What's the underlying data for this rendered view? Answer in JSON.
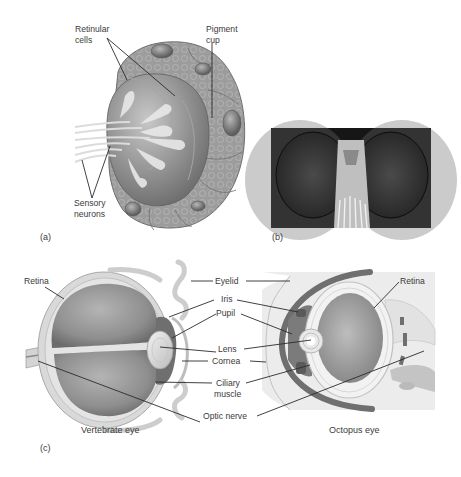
{
  "panel_a": {
    "part_label": "(a)",
    "labels": {
      "retinular_line1": "Retinular",
      "retinular_line2": "cells",
      "pigment_line1": "Pigment",
      "pigment_line2": "cup",
      "sensory_line1": "Sensory",
      "sensory_line2": "neurons"
    }
  },
  "panel_b": {
    "part_label": "(b)",
    "description": "Photograph of insect compound eyes"
  },
  "panel_c": {
    "part_label": "(c)",
    "left_caption": "Vertebrate eye",
    "right_caption": "Octopus eye",
    "labels": {
      "retina_left": "Retina",
      "retina_right": "Retina",
      "eyelid": "Eyelid",
      "iris": "Iris",
      "pupil": "Pupil",
      "lens": "Lens",
      "cornea": "Cornea",
      "ciliary_line1": "Ciliary",
      "ciliary_line2": "muscle",
      "optic_nerve": "Optic nerve"
    }
  },
  "colors": {
    "background": "#ffffff",
    "tissue_dark": "#7a7a7a",
    "tissue_mid": "#9a9a9a",
    "tissue_light": "#c9c9c9",
    "leader_line": "#2b2b2b",
    "text": "#3a3a3a"
  }
}
